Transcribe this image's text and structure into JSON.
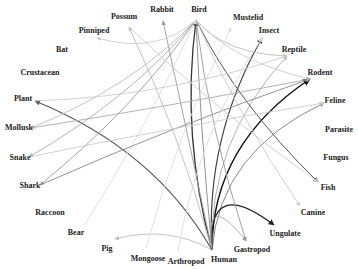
{
  "nodes": [
    {
      "id": "Bird",
      "label": "Bird",
      "x": 199,
      "y": 10,
      "px": 196,
      "py": 20
    },
    {
      "id": "Mustelid",
      "label": "Mustelid",
      "x": 248,
      "y": 18,
      "px": 231,
      "py": 28
    },
    {
      "id": "Insect",
      "label": "Insect",
      "x": 269,
      "y": 31,
      "px": 262,
      "py": 38
    },
    {
      "id": "Reptile",
      "label": "Reptile",
      "x": 294,
      "y": 50,
      "px": 287,
      "py": 56
    },
    {
      "id": "Rodent",
      "label": "Rodent",
      "x": 320,
      "y": 73,
      "px": 310,
      "py": 79
    },
    {
      "id": "Feline",
      "label": "Feline",
      "x": 335,
      "y": 101,
      "px": 324,
      "py": 103
    },
    {
      "id": "Parasite",
      "label": "Parasite",
      "x": 339,
      "y": 130,
      "px": 326,
      "py": 130
    },
    {
      "id": "Fungus",
      "label": "Fungus",
      "x": 336,
      "y": 158,
      "px": 324,
      "py": 158
    },
    {
      "id": "Fish",
      "label": "Fish",
      "x": 328,
      "y": 188,
      "px": 318,
      "py": 182
    },
    {
      "id": "Canine",
      "label": "Canine",
      "x": 313,
      "y": 213,
      "px": 300,
      "py": 206
    },
    {
      "id": "Ungulate",
      "label": "Ungulate",
      "x": 285,
      "y": 234,
      "px": 274,
      "py": 225
    },
    {
      "id": "Gastropod",
      "label": "Gastropod",
      "x": 252,
      "y": 250,
      "px": 246,
      "py": 241
    },
    {
      "id": "Human",
      "label": "Human",
      "x": 224,
      "y": 260,
      "px": 212,
      "py": 250
    },
    {
      "id": "Arthropod",
      "label": "Arthropod",
      "x": 186,
      "y": 262,
      "px": 178,
      "py": 252
    },
    {
      "id": "Mongoose",
      "label": "Mongoose",
      "x": 148,
      "y": 259,
      "px": 146,
      "py": 248
    },
    {
      "id": "Pig",
      "label": "Pig",
      "x": 107,
      "y": 249,
      "px": 115,
      "py": 239
    },
    {
      "id": "Bear",
      "label": "Bear",
      "x": 76,
      "y": 233,
      "px": 84,
      "py": 226
    },
    {
      "id": "Raccoon",
      "label": "Raccoon",
      "x": 50,
      "y": 213,
      "px": 64,
      "py": 210
    },
    {
      "id": "Shark",
      "label": "Shark",
      "x": 30,
      "y": 186,
      "px": 40,
      "py": 185
    },
    {
      "id": "Snake",
      "label": "Snake",
      "x": 20,
      "y": 158,
      "px": 29,
      "py": 157
    },
    {
      "id": "Mollusk",
      "label": "Mollusk",
      "x": 19,
      "y": 128,
      "px": 31,
      "py": 128
    },
    {
      "id": "Plant",
      "label": "Plant",
      "x": 23,
      "y": 99,
      "px": 35,
      "py": 101
    },
    {
      "id": "Crustacean",
      "label": "Crustacean",
      "x": 40,
      "y": 73,
      "px": 50,
      "py": 73
    },
    {
      "id": "Bat",
      "label": "Bat",
      "x": 62,
      "y": 50,
      "px": 62,
      "py": 52
    },
    {
      "id": "Pinniped",
      "label": "Pinniped",
      "x": 94,
      "y": 31,
      "px": 97,
      "py": 38
    },
    {
      "id": "Possum",
      "label": "Possum",
      "x": 124,
      "y": 17,
      "px": 129,
      "py": 27
    },
    {
      "id": "Rabbit",
      "label": "Rabbit",
      "x": 162,
      "y": 10,
      "px": 163,
      "py": 21
    }
  ],
  "edges": [
    {
      "from": "Human",
      "to": "Bird",
      "color": "#333333",
      "width": 1.3,
      "bend": -12
    },
    {
      "from": "Human",
      "to": "Bird",
      "color": "#888888",
      "width": 0.9,
      "bend": 8
    },
    {
      "from": "Human",
      "to": "Insect",
      "color": "#444444",
      "width": 1.2,
      "bend": -6
    },
    {
      "from": "Human",
      "to": "Rodent",
      "color": "#111111",
      "width": 1.5,
      "bend": -14
    },
    {
      "from": "Human",
      "to": "Reptile",
      "color": "#aaaaaa",
      "width": 0.9,
      "bend": -10
    },
    {
      "from": "Human",
      "to": "Feline",
      "color": "#888888",
      "width": 1.0,
      "bend": -10
    },
    {
      "from": "Human",
      "to": "Ungulate",
      "color": "#222222",
      "width": 1.2,
      "bend": -18
    },
    {
      "from": "Human",
      "to": "Gastropod",
      "color": "#aaaaaa",
      "width": 0.9,
      "bend": -8
    },
    {
      "from": "Human",
      "to": "Pig",
      "color": "#bbbbbb",
      "width": 0.9,
      "bend": -30
    },
    {
      "from": "Human",
      "to": "Rabbit",
      "color": "#999999",
      "width": 0.9,
      "bend": 4
    },
    {
      "from": "Human",
      "to": "Possum",
      "color": "#bbbbbb",
      "width": 0.9,
      "bend": 6
    },
    {
      "from": "Human",
      "to": "Plant",
      "color": "#555555",
      "width": 1.1,
      "bend": 10
    },
    {
      "from": "Bird",
      "to": "Fish",
      "color": "#555555",
      "width": 1.0,
      "bend": -20
    },
    {
      "from": "Bird",
      "to": "Canine",
      "color": "#cccccc",
      "width": 0.9,
      "bend": -22
    },
    {
      "from": "Bird",
      "to": "Reptile",
      "color": "#bbbbbb",
      "width": 0.9,
      "bend": -30
    },
    {
      "from": "Bird",
      "to": "Rodent",
      "color": "#cccccc",
      "width": 0.9,
      "bend": -30
    },
    {
      "from": "Bird",
      "to": "Gastropod",
      "color": "#999999",
      "width": 0.9,
      "bend": -8
    },
    {
      "from": "Bird",
      "to": "Mollusk",
      "color": "#bbbbbb",
      "width": 0.9,
      "bend": 18
    },
    {
      "from": "Bird",
      "to": "Snake",
      "color": "#aaaaaa",
      "width": 0.9,
      "bend": 16
    },
    {
      "from": "Bird",
      "to": "Shark",
      "color": "#999999",
      "width": 0.9,
      "bend": 14
    },
    {
      "from": "Bird",
      "to": "Pinniped",
      "color": "#cccccc",
      "width": 0.9,
      "bend": 22
    },
    {
      "from": "Mongoose",
      "to": "Mustelid",
      "color": "#dddddd",
      "width": 0.9,
      "bend": -8
    },
    {
      "from": "Bear",
      "to": "Bird",
      "color": "#dddddd",
      "width": 0.9,
      "bend": -10
    },
    {
      "from": "Shark",
      "to": "Rodent",
      "color": "#888888",
      "width": 0.9,
      "bend": -8
    },
    {
      "from": "Snake",
      "to": "Feline",
      "color": "#cccccc",
      "width": 0.9,
      "bend": -6
    },
    {
      "from": "Mollusk",
      "to": "Rodent",
      "color": "#aaaaaa",
      "width": 0.9,
      "bend": -12
    },
    {
      "from": "Plant",
      "to": "Reptile",
      "color": "#cccccc",
      "width": 0.9,
      "bend": -8
    },
    {
      "from": "Possum",
      "to": "Fish",
      "color": "#cccccc",
      "width": 0.9,
      "bend": -14
    },
    {
      "from": "Arthropod",
      "to": "Insect",
      "color": "#dddddd",
      "width": 0.9,
      "bend": -6
    }
  ]
}
